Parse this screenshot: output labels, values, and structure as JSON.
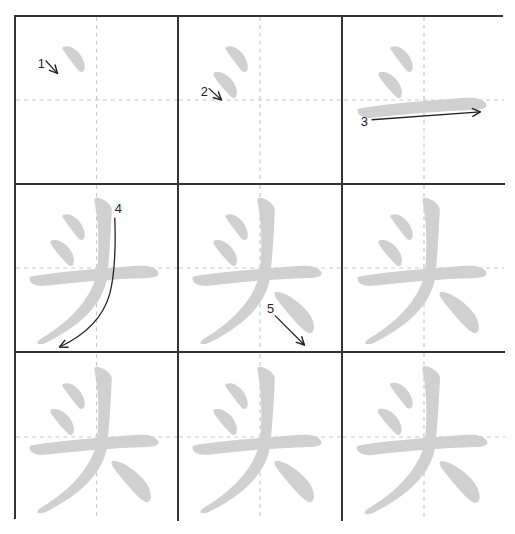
{
  "character": "头",
  "colors": {
    "grid_border": "#333333",
    "guide_line": "#c8c8c8",
    "stroke_fill": "#d0d0d0",
    "arrow": "#222222",
    "background": "#ffffff"
  },
  "grid": {
    "rows": 3,
    "columns": 3
  },
  "cells": [
    {
      "index": 1,
      "strokes_shown": 1,
      "label": "1",
      "annotated_stroke": "dot-upper"
    },
    {
      "index": 2,
      "strokes_shown": 2,
      "label": "2",
      "annotated_stroke": "dot-lower"
    },
    {
      "index": 3,
      "strokes_shown": 3,
      "label": "3",
      "annotated_stroke": "horizontal"
    },
    {
      "index": 4,
      "strokes_shown": 4,
      "label": "4",
      "annotated_stroke": "vertical-left-falling"
    },
    {
      "index": 5,
      "strokes_shown": 5,
      "label": "5",
      "annotated_stroke": "right-falling-dot"
    },
    {
      "index": 6,
      "strokes_shown": 5,
      "label": "",
      "annotated_stroke": ""
    },
    {
      "index": 7,
      "strokes_shown": 5,
      "label": "",
      "annotated_stroke": ""
    },
    {
      "index": 8,
      "strokes_shown": 5,
      "label": "",
      "annotated_stroke": ""
    },
    {
      "index": 9,
      "strokes_shown": 5,
      "label": "",
      "annotated_stroke": ""
    }
  ],
  "stroke_numbers": [
    "1",
    "2",
    "3",
    "4",
    "5"
  ]
}
